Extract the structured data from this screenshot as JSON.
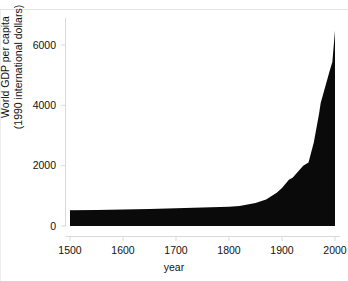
{
  "figure": {
    "cutoff_caption": "Figure — long run economic growth",
    "background_color": "#ffffff",
    "series_color": "#0a0a0a",
    "axis_color": "#d9d9dd",
    "tick_label_color": "#111111"
  },
  "chart_data": {
    "type": "area",
    "title": "",
    "subtitle": "",
    "xlabel": "year",
    "ylabel": "World GDP per capita\n(1990 international dollars)",
    "ylabel_line1": "World GDP per capita",
    "ylabel_line2": "(1990 international dollars)",
    "xlim": [
      1500,
      2000
    ],
    "ylim": [
      0,
      6600
    ],
    "xticks": [
      1500,
      1600,
      1700,
      1800,
      1900,
      2000
    ],
    "xticklabels": [
      "1500",
      "1600",
      "1700",
      "1800",
      "1900",
      "2000"
    ],
    "yticks": [
      0,
      2000,
      4000,
      6000
    ],
    "yticklabels": [
      "0",
      "2000",
      "4000",
      "6000"
    ],
    "grid": false,
    "legend": false,
    "fill_color": "#0a0a0a",
    "baseline": 0,
    "series": [
      {
        "name": "World GDP per capita",
        "x": [
          1500,
          1550,
          1600,
          1650,
          1700,
          1750,
          1800,
          1820,
          1850,
          1870,
          1890,
          1900,
          1913,
          1920,
          1930,
          1940,
          1950,
          1960,
          1970,
          1973,
          1980,
          1990,
          1995,
          2000
        ],
        "values": [
          520,
          530,
          545,
          560,
          585,
          610,
          640,
          665,
          760,
          875,
          1100,
          1260,
          1530,
          1600,
          1800,
          2000,
          2110,
          2770,
          3730,
          4080,
          4520,
          5150,
          5440,
          6480
        ]
      }
    ]
  }
}
